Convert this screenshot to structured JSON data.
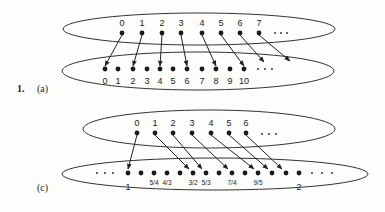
{
  "problem_number": "1.",
  "part_a": {
    "label": "(a)",
    "top_set": {
      "labels": [
        "0",
        "1",
        "2",
        "3",
        "4",
        "5",
        "6",
        "7"
      ],
      "dot_x": [
        122,
        142,
        162,
        181,
        202,
        221,
        240,
        259
      ],
      "ellipsis": "..."
    },
    "bottom_set": {
      "labels": [
        "0",
        "1",
        "2",
        "3",
        "4",
        "5",
        "6",
        "7",
        "8",
        "9",
        "10"
      ],
      "dot_x": [
        105,
        118,
        133,
        147,
        160,
        173,
        187,
        202,
        216,
        230,
        244
      ],
      "ellipsis": "..."
    },
    "mapping": [
      [
        0,
        0
      ],
      [
        1,
        2
      ],
      [
        2,
        4
      ],
      [
        3,
        6
      ],
      [
        4,
        8
      ],
      [
        5,
        10
      ],
      [
        6,
        "12"
      ],
      [
        7,
        "14"
      ]
    ]
  },
  "part_c": {
    "label": "(c)",
    "top_set": {
      "labels": [
        "0",
        "1",
        "2",
        "3",
        "4",
        "5",
        "6"
      ],
      "dot_x": [
        137,
        155,
        173,
        192,
        211,
        229,
        246
      ],
      "ellipsis": "..."
    },
    "bottom_set": {
      "dot_x": [
        128,
        141,
        154,
        167,
        180,
        193,
        206,
        219,
        232,
        245,
        258,
        272,
        286,
        299
      ],
      "labels": [
        {
          "text": "1",
          "x": 128,
          "big": true
        },
        {
          "text": "5/4",
          "x": 154
        },
        {
          "text": "4/3",
          "x": 167
        },
        {
          "text": "3/2",
          "x": 193
        },
        {
          "text": "5/3",
          "x": 206
        },
        {
          "text": "7/4",
          "x": 232
        },
        {
          "text": "9/5",
          "x": 258
        },
        {
          "text": "2",
          "x": 299,
          "big": true
        }
      ],
      "ellipsis": "..."
    },
    "mapping_target_x": [
      128,
      193,
      206,
      232,
      258,
      272,
      286
    ]
  }
}
